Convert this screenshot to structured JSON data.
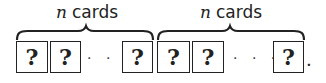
{
  "diagram": {
    "groups": [
      {
        "label_var": "n",
        "label_text": "cards",
        "cards": [
          "?",
          "?",
          "?"
        ],
        "ellipsis": "· · ·"
      },
      {
        "label_var": "n",
        "label_text": "cards",
        "cards": [
          "?",
          "?",
          "?"
        ],
        "ellipsis": "· · ·"
      }
    ],
    "terminator": "."
  }
}
